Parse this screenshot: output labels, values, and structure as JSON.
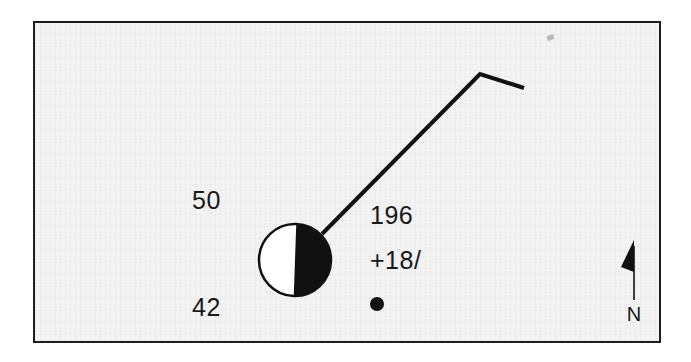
{
  "figure": {
    "type": "seismic-focal-mechanism-map",
    "background_color": "#f3f3f3",
    "frame_color": "#1d1d1d",
    "ink_color": "#111111"
  },
  "labels": {
    "depth_upper": "50",
    "depth_lower": "42",
    "strike": "196",
    "slip": "+18/"
  },
  "beachball": {
    "name": "focal-mechanism-beachball",
    "center_x": 260,
    "center_y": 237,
    "radius": 36,
    "left_half_color": "#ffffff",
    "right_half_color": "#111111",
    "outline_color": "#111111"
  },
  "epicenter_dot": {
    "name": "epicenter-dot",
    "center_x": 342,
    "center_y": 281,
    "radius": 7,
    "color": "#111111"
  },
  "fault_trace": {
    "name": "fault-trace-polyline",
    "stroke_color": "#111111",
    "stroke_width": 4,
    "points": [
      {
        "x": 287,
        "y": 211
      },
      {
        "x": 445,
        "y": 51
      },
      {
        "x": 489,
        "y": 65
      }
    ]
  },
  "north_arrow": {
    "label": "N",
    "stem_color": "#111111",
    "head_color": "#111111"
  },
  "artifacts": {
    "scan_speck": "scan-speck"
  }
}
